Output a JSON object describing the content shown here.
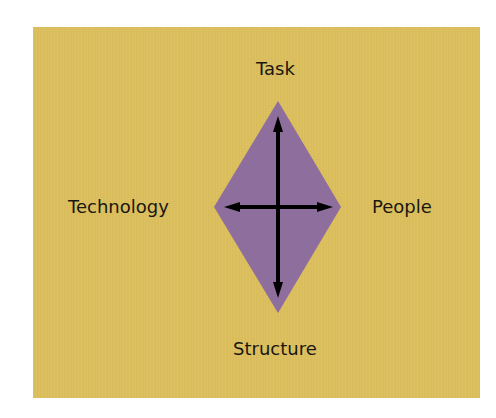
{
  "diagram": {
    "type": "leavitt-diamond",
    "labels": {
      "top": "Task",
      "left": "Technology",
      "right": "People",
      "bottom": "Structure"
    },
    "colors": {
      "background": "#dcbf5c",
      "diamond": "#8e6e9c",
      "arrows": "#000000",
      "text": "#1a1712"
    },
    "arrows": [
      {
        "from": "top",
        "to": "bottom",
        "bidirectional": true
      },
      {
        "from": "left",
        "to": "right",
        "bidirectional": true
      }
    ]
  }
}
